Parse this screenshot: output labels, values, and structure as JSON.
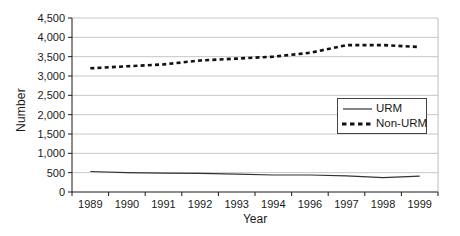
{
  "figure": {
    "background": "#ffffff"
  },
  "chart_data": {
    "type": "line",
    "title": "",
    "xlabel": "Year",
    "ylabel": "Number",
    "categories": [
      "1989",
      "1990",
      "1991",
      "1992",
      "1993",
      "1994",
      "1996",
      "1997",
      "1998",
      "1999"
    ],
    "series": [
      {
        "name": "URM",
        "values": [
          530,
          500,
          490,
          480,
          460,
          440,
          440,
          420,
          370,
          410
        ],
        "line_style": "solid",
        "stroke_width": 1.2,
        "color": "#333333"
      },
      {
        "name": "Non-URM",
        "values": [
          3200,
          3250,
          3300,
          3400,
          3450,
          3500,
          3600,
          3800,
          3800,
          3750
        ],
        "line_style": "dashed",
        "stroke_width": 2.6,
        "color": "#111111"
      }
    ],
    "ylim": [
      0,
      4500
    ],
    "y_tick_step": 500,
    "y_tick_labels": [
      "0",
      "500",
      "1,000",
      "1,500",
      "2,000",
      "2,500",
      "3,000",
      "3,500",
      "4,000",
      "4,500"
    ],
    "grid": "horizontal",
    "legend_position": "middle-right",
    "colors": {
      "grid": "#c6c6c6",
      "axis": "#1a1a1a",
      "tick": "#1a1a1a",
      "text": "#1a1a1a",
      "right_border": "#bdbdbd",
      "background": "#ffffff"
    }
  }
}
